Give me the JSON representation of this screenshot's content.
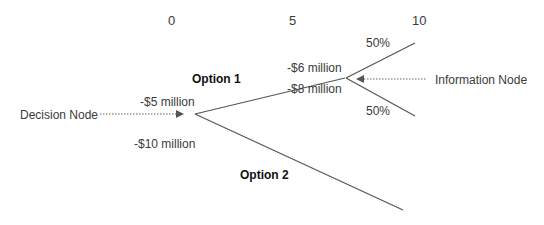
{
  "axis_ticks": [
    "0",
    "5",
    "10"
  ],
  "options": {
    "option1": "Option 1",
    "option2": "Option 2"
  },
  "costs": {
    "option1_cost": "-$5 million",
    "option2_cost": "-$10 million",
    "outcome_high": "-$6 million",
    "outcome_low": "-$8 million"
  },
  "probabilities": {
    "upper": "50%",
    "lower": "50%"
  },
  "nodes": {
    "decision": "Decision Node",
    "information": "Information Node"
  },
  "colors": {
    "line": "#555555",
    "text": "#3a3a3a"
  }
}
